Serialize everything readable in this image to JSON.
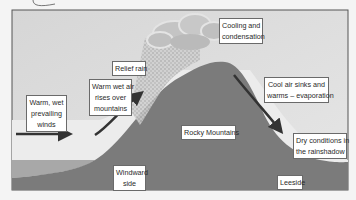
{
  "diagram": {
    "colors": {
      "sky": "#d9d9d9",
      "sky_light": "#e9e9e9",
      "mountain": "#7b7b7b",
      "sea": "#a6a6a6",
      "cloud": "#bdbdbd",
      "arrow": "#333333",
      "frame": "#555555"
    },
    "labels": {
      "warm_wet_winds": [
        "Warm, wet",
        "prevailing",
        "winds"
      ],
      "relief_rain": "Relief rain",
      "warm_air_rises": [
        "Warm wet air",
        "rises over",
        "mountains"
      ],
      "cooling": [
        "Cooling and",
        "condensation"
      ],
      "cool_air_sinks": [
        "Cool air sinks and",
        "warms – evaporation"
      ],
      "rocky_mountains": "Rocky Mountains",
      "dry_conditions": [
        "Dry conditions in",
        "the rainshadow"
      ],
      "windward_side": [
        "Windward",
        "side"
      ],
      "leeside": "Leeside"
    },
    "arrows": [
      {
        "name": "prevailing-winds-arrow",
        "direction": "right"
      },
      {
        "name": "rising-air-arrow",
        "direction": "up-right"
      },
      {
        "name": "sinking-air-arrow",
        "direction": "down-right"
      }
    ]
  }
}
